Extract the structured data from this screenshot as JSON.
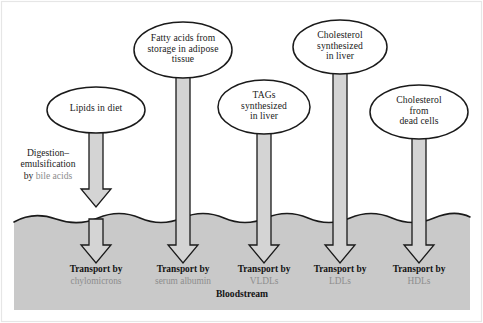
{
  "figure": {
    "width": 483,
    "height": 323,
    "colors": {
      "background": "#ffffff",
      "bloodstream_fill": "#c9c9c9",
      "arrow_fill": "#d4d4d4",
      "outline": "#1a1a1a",
      "text": "#1a1a1a",
      "muted_text": "#8d8d8d",
      "frame": "#e2e2e2"
    }
  },
  "sources": [
    {
      "id": "lipids-in-diet",
      "label": "Lipids in diet",
      "lines": [
        "Lipids in diet"
      ],
      "cx": 96,
      "cy": 110,
      "rx": 49,
      "ry": 23
    },
    {
      "id": "fatty-acids-adipose",
      "label": "Fatty acids from storage in adipose tissue",
      "lines": [
        "Fatty acids from",
        "storage in adipose",
        "tissue"
      ],
      "cx": 183,
      "cy": 50,
      "rx": 49,
      "ry": 28
    },
    {
      "id": "tags-synthesized-liver",
      "label": "TAGs synthesized in liver",
      "lines": [
        "TAGs",
        "synthesized",
        "in liver"
      ],
      "cx": 264,
      "cy": 107,
      "rx": 46,
      "ry": 27
    },
    {
      "id": "cholesterol-synthesized-liver",
      "label": "Cholesterol synthesized in liver",
      "lines": [
        "Cholesterol",
        "synthesized",
        "in liver"
      ],
      "cx": 340,
      "cy": 47,
      "rx": 47,
      "ry": 27
    },
    {
      "id": "cholesterol-dead-cells",
      "label": "Cholesterol from dead cells",
      "lines": [
        "Cholesterol",
        "from",
        "dead cells"
      ],
      "cx": 419,
      "cy": 112,
      "rx": 49,
      "ry": 27
    }
  ],
  "side_note": {
    "id": "digestion-emulsification",
    "lines": [
      {
        "text": "Digestion–",
        "muted": false
      },
      {
        "text": "emulsification",
        "muted": false
      }
    ],
    "last_line_prefix": "by ",
    "last_line_muted": "bile acids"
  },
  "transports": [
    {
      "id": "chylomicrons",
      "top": "Transport by",
      "bottom": "chylomicrons",
      "cx": 96
    },
    {
      "id": "serum-albumin",
      "top": "Transport by",
      "bottom": "serum albumin",
      "cx": 183
    },
    {
      "id": "vldls",
      "top": "Transport by",
      "bottom": "VLDLs",
      "cx": 264
    },
    {
      "id": "ldls",
      "top": "Transport by",
      "bottom": "LDLs",
      "cx": 340
    },
    {
      "id": "hdls",
      "top": "Transport by",
      "bottom": "HDLs",
      "cx": 419
    }
  ],
  "bloodstream": {
    "label": "Bloodstream",
    "label_x": 242,
    "label_y": 295
  }
}
